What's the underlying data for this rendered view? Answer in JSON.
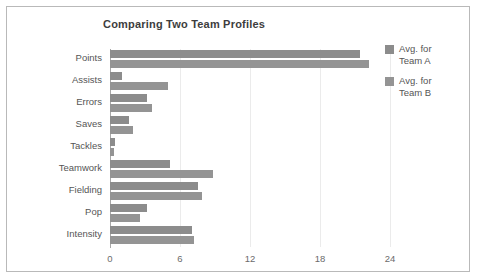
{
  "chart_data": {
    "type": "bar",
    "orientation": "horizontal",
    "title": "Comparing Two Team Profiles",
    "xlabel": "",
    "ylabel": "",
    "xlim": [
      0,
      24
    ],
    "xticks": [
      0,
      6,
      12,
      18,
      24
    ],
    "xtick_labels": [
      "0",
      "6",
      "12",
      "18",
      "24"
    ],
    "grid": true,
    "legend_position": "right",
    "categories": [
      "Points",
      "Assists",
      "Errors",
      "Saves",
      "Tackles",
      "Teamwork",
      "Fielding",
      "Pop",
      "Intensity"
    ],
    "series": [
      {
        "name": "Avg. for\nTeam A",
        "color": "#8c8c8c",
        "values": [
          21.4,
          1.0,
          3.2,
          1.6,
          0.4,
          5.1,
          7.5,
          3.2,
          7.0
        ]
      },
      {
        "name": "Avg. for\nTeam B",
        "color": "#949494",
        "values": [
          22.2,
          5.0,
          3.6,
          2.0,
          0.3,
          8.8,
          7.9,
          2.6,
          7.2
        ]
      }
    ]
  },
  "legend": {
    "items": [
      {
        "label": "Avg. for\nTeam A"
      },
      {
        "label": "Avg. for\nTeam B"
      }
    ]
  }
}
